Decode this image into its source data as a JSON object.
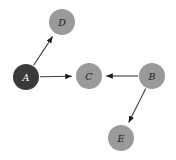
{
  "figure": {
    "kind": "directed-graph",
    "background_color": "#ffffff",
    "width": 176,
    "height": 160
  },
  "style": {
    "node_radius": 13,
    "node_fill_default": "#9a9a9a",
    "node_fill_highlight": "#3a3a3a",
    "node_label_color_default": "#1a1a1a",
    "node_label_color_highlight": "#ffffff",
    "edge_color": "#3d3d3d",
    "arrow_color": "#1a1a1a"
  },
  "nodes": [
    {
      "id": "A",
      "label": "A",
      "cx": 26,
      "cy": 77,
      "r": 13,
      "fill": "#3a3a3a",
      "label_color": "#ffffff"
    },
    {
      "id": "D",
      "label": "D",
      "cx": 62,
      "cy": 22,
      "r": 13,
      "fill": "#9a9a9a",
      "label_color": "#1a1a1a"
    },
    {
      "id": "C",
      "label": "C",
      "cx": 89,
      "cy": 76,
      "r": 13,
      "fill": "#9a9a9a",
      "label_color": "#1a1a1a"
    },
    {
      "id": "B",
      "label": "B",
      "cx": 152,
      "cy": 76,
      "r": 13,
      "fill": "#9a9a9a",
      "label_color": "#1a1a1a"
    },
    {
      "id": "E",
      "label": "E",
      "cx": 121,
      "cy": 138,
      "r": 13,
      "fill": "#9a9a9a",
      "label_color": "#1a1a1a"
    }
  ],
  "edges": [
    {
      "id": "A-D",
      "source": "A",
      "target": "D",
      "directed": true,
      "label": ""
    },
    {
      "id": "A-C",
      "source": "A",
      "target": "C",
      "directed": true,
      "label": ""
    },
    {
      "id": "B-C",
      "source": "B",
      "target": "C",
      "directed": true,
      "label": ""
    },
    {
      "id": "B-E",
      "source": "B",
      "target": "E",
      "directed": true,
      "label": ""
    }
  ]
}
